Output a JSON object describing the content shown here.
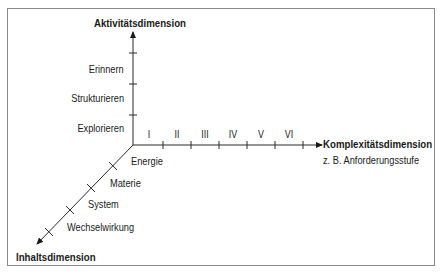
{
  "axes": {
    "activity": {
      "title": "Aktivitätsdimension",
      "labels": [
        "Erinnern",
        "Strukturieren",
        "Explorieren"
      ]
    },
    "complexity": {
      "title": "Komplexitätsdimension",
      "subtitle": "z. B. Anforderungsstufe",
      "levels": [
        "I",
        "II",
        "III",
        "IV",
        "V",
        "VI"
      ]
    },
    "content": {
      "title": "Inhaltsdimension",
      "labels": [
        "Energie",
        "Materie",
        "System",
        "Wechselwirkung"
      ]
    }
  },
  "colors": {
    "line": "#2a2a2a",
    "frame": "#8a8a8a"
  }
}
